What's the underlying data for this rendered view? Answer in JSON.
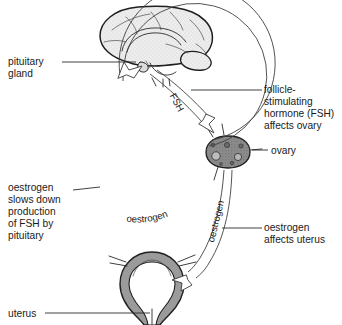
{
  "figure": {
    "type": "biology-diagram",
    "background_color": "#ffffff",
    "ink_color": "#1a1a1a"
  },
  "labels": {
    "pituitary_gland": {
      "lines": [
        "pituitary",
        "gland"
      ],
      "line1": "pituitary",
      "line2": "gland"
    },
    "fsh_affects_ovary": {
      "lines": [
        "follicle-",
        "stimulating",
        "hormone (FSH)",
        "affects ovary"
      ],
      "line1": "follicle-",
      "line2": "stimulating",
      "line3": "hormone (FSH)",
      "line4": "affects ovary"
    },
    "ovary": {
      "text": "ovary"
    },
    "oestrogen_feedback": {
      "lines": [
        "oestrogen",
        "slows down",
        "production",
        "of FSH by",
        "pituitary"
      ],
      "line1": "oestrogen",
      "line2": "slows down",
      "line3": "production",
      "line4": "of FSH by",
      "line5": "pituitary"
    },
    "oestrogen_affects_uterus": {
      "lines": [
        "oestrogen",
        "affects uterus"
      ],
      "line1": "oestrogen",
      "line2": "affects uterus"
    },
    "uterus": {
      "text": "uterus"
    }
  },
  "pathway_labels": {
    "fsh_arrow": "FSH",
    "oestrogen_to_uterus": "oestrogen",
    "oestrogen_feedback_arc": "oestrogen"
  },
  "organs": {
    "brain": {
      "name": "brain",
      "fill": "#e8e8e8"
    },
    "ovary": {
      "name": "ovary",
      "fill": "#8a8a8a"
    },
    "uterus": {
      "name": "uterus",
      "fill": "#9a9a9a"
    }
  },
  "arrows": {
    "fsh": {
      "from": "pituitary gland",
      "to": "ovary",
      "style": "outlined"
    },
    "oestrogen_uterus": {
      "from": "ovary",
      "to": "uterus",
      "style": "outlined"
    },
    "oestrogen_feedback": {
      "from": "ovary",
      "to": "pituitary gland",
      "style": "outlined-circular"
    }
  }
}
